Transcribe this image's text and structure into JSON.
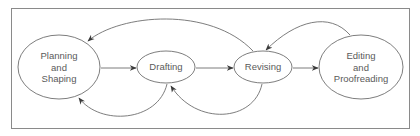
{
  "diagram": {
    "type": "cyclic-process-flow",
    "colors": {
      "stroke": "#6e6e6e",
      "frame": "#8a8a8a",
      "text": "#5a5a5a",
      "background": "#ffffff"
    },
    "nodes": [
      {
        "id": "planning",
        "lines": [
          "Planning",
          "and",
          "Shaping"
        ],
        "cx": 59,
        "cy": 67,
        "rx": 41,
        "ry": 32
      },
      {
        "id": "drafting",
        "lines": [
          "Drafting"
        ],
        "cx": 166,
        "cy": 67,
        "rx": 29,
        "ry": 16
      },
      {
        "id": "revising",
        "lines": [
          "Revising"
        ],
        "cx": 263,
        "cy": 67,
        "rx": 29,
        "ry": 16
      },
      {
        "id": "editing",
        "lines": [
          "Editing",
          "and",
          "Proofreading"
        ],
        "cx": 361,
        "cy": 67,
        "rx": 42,
        "ry": 32
      }
    ],
    "edges": [
      {
        "from": "planning",
        "to": "drafting",
        "kind": "straight"
      },
      {
        "from": "drafting",
        "to": "revising",
        "kind": "straight"
      },
      {
        "from": "revising",
        "to": "editing",
        "kind": "straight"
      },
      {
        "from": "drafting",
        "to": "planning",
        "kind": "curve-below"
      },
      {
        "from": "revising",
        "to": "drafting",
        "kind": "curve-below"
      },
      {
        "from": "revising",
        "to": "planning",
        "kind": "curve-above"
      },
      {
        "from": "editing",
        "to": "revising",
        "kind": "curve-above"
      }
    ]
  },
  "labels": {
    "planning": {
      "line1": "Planning",
      "line2": "and",
      "line3": "Shaping"
    },
    "drafting": {
      "line1": "Drafting"
    },
    "revising": {
      "line1": "Revising"
    },
    "editing": {
      "line1": "Editing",
      "line2": "and",
      "line3": "Proofreading"
    }
  }
}
